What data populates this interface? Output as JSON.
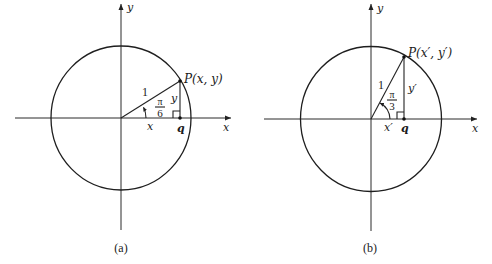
{
  "figure": {
    "panels": [
      {
        "id": "a",
        "caption": "(a)",
        "axis_labels": {
          "x": "x",
          "y": "y"
        },
        "point_label": "P(x, y)",
        "radius_label": "1",
        "angle": {
          "numerator": "π",
          "denominator": "6"
        },
        "leg_labels": {
          "horizontal": "x",
          "vertical": "y"
        },
        "foot_label": "q"
      },
      {
        "id": "b",
        "caption": "(b)",
        "axis_labels": {
          "x": "x",
          "y": "y"
        },
        "point_label": "P(x′, y′)",
        "radius_label": "1",
        "angle": {
          "numerator": "π",
          "denominator": "3"
        },
        "leg_labels": {
          "horizontal": "x′",
          "vertical": "y′"
        },
        "foot_label": "q"
      }
    ]
  }
}
